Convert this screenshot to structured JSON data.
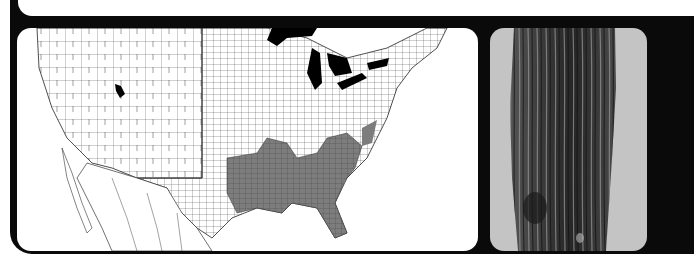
{
  "figure": {
    "panels": [
      {
        "id": "range-map",
        "description": "County-level map of the contiguous United States with northern Mexico; shaded counties show species range in the southeastern US",
        "colors": {
          "background": "#ffffff",
          "county_lines": "#333333",
          "range_fill": "#7a7a7a",
          "water": "#000000"
        },
        "highlighted_regions": [
          "Louisiana",
          "Mississippi",
          "Alabama",
          "Georgia",
          "South Carolina",
          "Florida",
          "East Texas",
          "North Carolina coast",
          "Utah (isolated)"
        ]
      },
      {
        "id": "bark-photo",
        "description": "Grayscale photograph of a tree trunk showing fibrous, shredded bark",
        "colors": {
          "background": "#c4c4c4",
          "bark_dark": "#2a2a2a",
          "bark_light": "#9a9a9a"
        }
      }
    ],
    "frame_color": "#0a0a0a"
  }
}
